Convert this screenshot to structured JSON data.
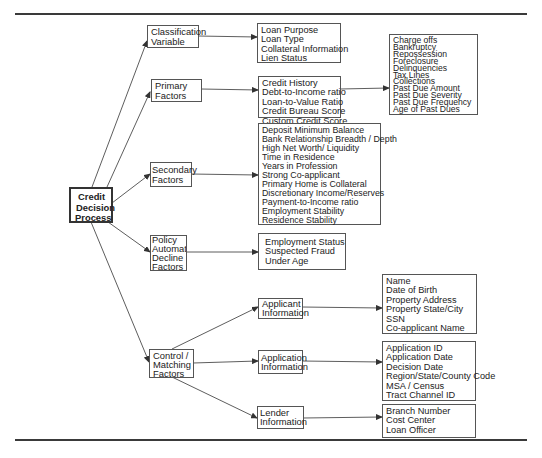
{
  "diagram": {
    "root": {
      "label_lines": [
        "Credit",
        "Decision",
        "Process"
      ]
    },
    "categories": [
      {
        "id": "classification",
        "label_lines": [
          "Classification",
          "Variable"
        ],
        "items": [
          "Loan Purpose",
          "Loan Type",
          "Collateral Information",
          "Lien Status"
        ]
      },
      {
        "id": "primary",
        "label_lines": [
          "Primary",
          "Factors"
        ],
        "items": [
          "Credit History",
          "Debt-to-Income ratio",
          "Loan-to-Value Ratio",
          "Credit Bureau Score",
          "Custom Credit Score"
        ],
        "sub_items": [
          "Charge offs",
          "Bankruptcy",
          "Repossession",
          "Foreclosure",
          "Delinquencies",
          "Tax Lines",
          "Collections",
          "Past Due Amount",
          "Past Due Severity",
          "Past Due Frequency",
          "Age of Past Dues"
        ]
      },
      {
        "id": "secondary",
        "label_lines": [
          "Secondary",
          "Factors"
        ],
        "items": [
          "Deposit Minimum Balance",
          "Bank Relationship Breadth / Depth",
          "High Net Worth/ Liquidity",
          "Time in Residence",
          "Years in Profession",
          "Strong Co-applicant",
          "Primary Home is Collateral",
          "Discretionary Income/Reserves",
          "Payment-to-Income ratio",
          "Employment Stability",
          "Residence Stability"
        ]
      },
      {
        "id": "policy",
        "label_lines": [
          "Policy",
          "Automatic",
          "Decline",
          "Factors"
        ],
        "items": [
          "Employment Status",
          "Suspected Fraud",
          "Under Age"
        ]
      },
      {
        "id": "control",
        "label_lines": [
          "Control /",
          "Matching",
          "Factors"
        ],
        "children": [
          {
            "id": "applicant",
            "label_lines": [
              "Applicant",
              "Information"
            ],
            "items": [
              "Name",
              "Date of Birth",
              "Property Address",
              "Property State/City",
              "SSN",
              "Co-applicant Name"
            ]
          },
          {
            "id": "application",
            "label_lines": [
              "Application",
              "Information"
            ],
            "items": [
              "Application ID",
              "Application Date",
              "Decision Date",
              "Region/State/County Code",
              "MSA / Census",
              "Tract Channel ID"
            ]
          },
          {
            "id": "lender",
            "label_lines": [
              "Lender",
              "Information"
            ],
            "items": [
              "Branch Number",
              "Cost Center",
              "Loan Officer"
            ]
          }
        ]
      }
    ]
  },
  "colors": {
    "line": "#333333",
    "box_border": "#555555",
    "rule": "#3a3a3a"
  }
}
